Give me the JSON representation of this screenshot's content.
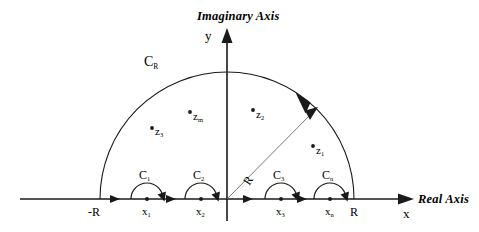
{
  "figure": {
    "type": "complex-contour-diagram",
    "title_none": "",
    "axes": {
      "imaginary_label": "Imaginary Axis",
      "imaginary_var": "y",
      "real_label": "Real Axis",
      "real_var": "x"
    },
    "contour": {
      "arc_label": "C",
      "arc_label_sub": "R",
      "radius_label": "R",
      "left_endpoint_label": "-R",
      "right_endpoint_label": "R"
    },
    "small_semicircles": [
      {
        "label": "C",
        "sub": "1",
        "point_label": "x",
        "point_sub": "1"
      },
      {
        "label": "C",
        "sub": "2",
        "point_label": "x",
        "point_sub": "2"
      },
      {
        "label": "C",
        "sub": "3",
        "point_label": "x",
        "point_sub": "3"
      },
      {
        "label": "C",
        "sub": "n",
        "point_label": "x",
        "point_sub": "n"
      }
    ],
    "poles": [
      {
        "label": "z",
        "sub": "3"
      },
      {
        "label": "z",
        "sub": "m"
      },
      {
        "label": "z",
        "sub": "2"
      },
      {
        "label": "z",
        "sub": "1"
      }
    ],
    "colors": {
      "stroke": "#1a1a1a",
      "radius_stroke": "#555555",
      "background": "#ffffff"
    }
  }
}
